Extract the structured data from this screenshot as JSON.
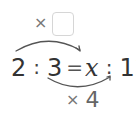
{
  "top_operator": {
    "symbol": "×",
    "answer_box_value": ""
  },
  "equation": {
    "left_a": "2",
    "colon_1": ":",
    "left_b": "3",
    "equals": "=",
    "right_a": "x",
    "colon_2": ":",
    "right_b": "12"
  },
  "bottom_operator": {
    "symbol": "×",
    "factor": "4"
  },
  "colors": {
    "text": "#333333",
    "operator": "#777777",
    "arc": "#555555",
    "box_border": "#d6d6d6"
  }
}
